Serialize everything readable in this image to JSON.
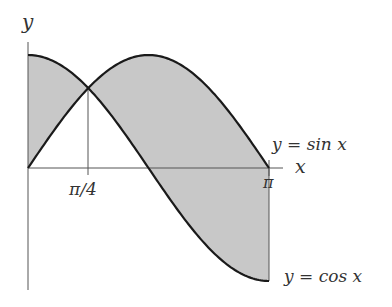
{
  "figure": {
    "axes": {
      "x_label": "x",
      "y_label": "y"
    },
    "ticks": {
      "pi_over_4": "π/4",
      "pi": "π"
    },
    "curve_labels": {
      "sin": "y = sin x",
      "cos": "y = cos x"
    },
    "colors": {
      "shaded_region": "#c8c8c8",
      "curve": "#1a1a1a",
      "axis": "#555555",
      "text": "#333333"
    }
  },
  "chart_data": {
    "type": "area",
    "title": "",
    "xlabel": "x",
    "ylabel": "y",
    "xlim": [
      0,
      3.14159
    ],
    "ylim": [
      -1,
      1
    ],
    "x_ticks": [
      {
        "value": 0.7854,
        "label": "π/4"
      },
      {
        "value": 3.14159,
        "label": "π"
      }
    ],
    "series": [
      {
        "name": "y = sin x",
        "function": "sin(x)",
        "domain": [
          0,
          3.14159
        ]
      },
      {
        "name": "y = cos x",
        "function": "cos(x)",
        "domain": [
          0,
          3.14159
        ]
      }
    ],
    "shaded_region": "Region between y = sin x and y = cos x for 0 ≤ x ≤ π",
    "intersection": {
      "x": 0.7854,
      "y": 0.7071,
      "label": "π/4"
    },
    "grid": false,
    "legend": "inline labels at right"
  }
}
